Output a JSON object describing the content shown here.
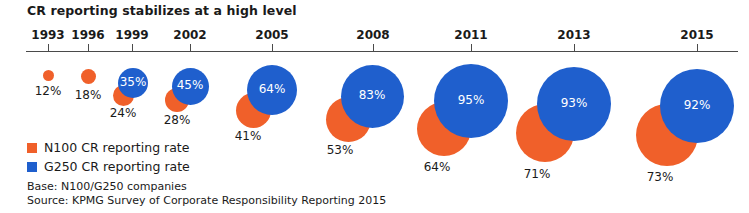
{
  "title": "CR reporting stabilizes at a high level",
  "legend": {
    "items": [
      {
        "key": "n100",
        "label": "N100 CR reporting rate",
        "color": "#f0602a"
      },
      {
        "key": "g250",
        "label": "G250 CR reporting rate",
        "color": "#1f5fcd"
      }
    ]
  },
  "footnotes": {
    "base": "Base: N100/G250 companies",
    "source": "Source: KPMG Survey of Corporate Responsibility Reporting 2015"
  },
  "chart_data": {
    "type": "bubble",
    "title": "CR reporting stabilizes at a high level",
    "xlabel": "",
    "ylabel": "",
    "grid": false,
    "legend_position": "bottom-left",
    "categories": [
      "1993",
      "1996",
      "1999",
      "2002",
      "2005",
      "2008",
      "2011",
      "2013",
      "2015"
    ],
    "series": [
      {
        "name": "N100 CR reporting rate",
        "color": "#f0602a",
        "values": [
          12,
          18,
          24,
          28,
          41,
          53,
          64,
          71,
          73
        ],
        "labels": [
          "12%",
          "18%",
          "24%",
          "28%",
          "41%",
          "53%",
          "64%",
          "71%",
          "73%"
        ]
      },
      {
        "name": "G250 CR reporting rate",
        "color": "#1f5fcd",
        "values": [
          null,
          null,
          35,
          45,
          64,
          83,
          95,
          93,
          92
        ],
        "labels": [
          "",
          "",
          "35%",
          "45%",
          "64%",
          "83%",
          "95%",
          "93%",
          "92%"
        ]
      }
    ]
  },
  "axis": {
    "ticks": [
      {
        "label": "1993",
        "x": 48
      },
      {
        "label": "1996",
        "x": 88
      },
      {
        "label": "1999",
        "x": 132
      },
      {
        "label": "2002",
        "x": 190
      },
      {
        "label": "2005",
        "x": 272
      },
      {
        "label": "2008",
        "x": 373
      },
      {
        "label": "2011",
        "x": 471
      },
      {
        "label": "2013",
        "x": 574
      },
      {
        "label": "2015",
        "x": 697
      }
    ]
  },
  "bubbles": {
    "g250": [
      {
        "year": "1999",
        "label": "35%",
        "cx": 133,
        "cy": 83,
        "d": 30,
        "label_dy": 0
      },
      {
        "year": "2002",
        "label": "45%",
        "cx": 190,
        "cy": 86,
        "d": 37,
        "label_dy": 0
      },
      {
        "year": "2005",
        "label": "64%",
        "cx": 272,
        "cy": 90,
        "d": 50,
        "label_dy": 0
      },
      {
        "year": "2008",
        "label": "83%",
        "cx": 372,
        "cy": 96,
        "d": 63,
        "label_dy": 0
      },
      {
        "year": "2011",
        "label": "95%",
        "cx": 471,
        "cy": 101,
        "d": 74,
        "label_dy": 0
      },
      {
        "year": "2013",
        "label": "93%",
        "cx": 574,
        "cy": 104,
        "d": 74,
        "label_dy": 0
      },
      {
        "year": "2015",
        "label": "92%",
        "cx": 697,
        "cy": 106,
        "d": 74,
        "label_dy": 0
      }
    ],
    "n100": [
      {
        "year": "1993",
        "label": "12%",
        "cx": 48,
        "cy": 75,
        "d": 11,
        "lx": 48,
        "ly": 84
      },
      {
        "year": "1996",
        "label": "18%",
        "cx": 88,
        "cy": 76,
        "d": 15,
        "lx": 88,
        "ly": 88
      },
      {
        "year": "1999",
        "label": "24%",
        "cx": 123,
        "cy": 95,
        "d": 21,
        "lx": 123,
        "ly": 106
      },
      {
        "year": "2002",
        "label": "28%",
        "cx": 177,
        "cy": 100,
        "d": 24,
        "lx": 177,
        "ly": 113
      },
      {
        "year": "2005",
        "label": "41%",
        "cx": 253,
        "cy": 110,
        "d": 35,
        "lx": 248,
        "ly": 129
      },
      {
        "year": "2008",
        "label": "53%",
        "cx": 348,
        "cy": 119,
        "d": 45,
        "lx": 340,
        "ly": 143
      },
      {
        "year": "2011",
        "label": "64%",
        "cx": 444,
        "cy": 129,
        "d": 54,
        "lx": 437,
        "ly": 160
      },
      {
        "year": "2013",
        "label": "71%",
        "cx": 545,
        "cy": 133,
        "d": 58,
        "lx": 537,
        "ly": 167
      },
      {
        "year": "2015",
        "label": "73%",
        "cx": 667,
        "cy": 135,
        "d": 62,
        "lx": 660,
        "ly": 170
      }
    ]
  }
}
